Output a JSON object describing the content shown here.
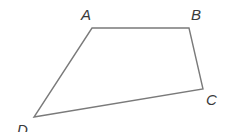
{
  "figure": {
    "type": "quadrilateral",
    "stroke_color": "#7a7a7a",
    "label_color": "#3a3a3a",
    "background": "#ffffff",
    "vertices": [
      {
        "name": "A",
        "x": 92,
        "y": 28
      },
      {
        "name": "B",
        "x": 189,
        "y": 28
      },
      {
        "name": "C",
        "x": 203,
        "y": 89
      },
      {
        "name": "D",
        "x": 34,
        "y": 117
      }
    ],
    "labels": {
      "A": "A",
      "B": "B",
      "C": "C",
      "D": "D"
    }
  }
}
